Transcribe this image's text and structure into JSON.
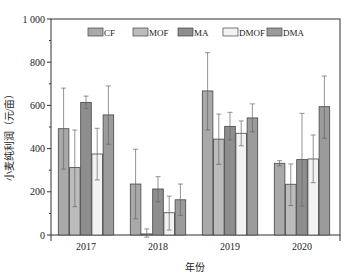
{
  "chart_data": {
    "type": "bar",
    "title": "",
    "xlabel": "年份",
    "ylabel": "小麦纯利润（元/亩）",
    "ylim": [
      0,
      1000
    ],
    "yticks": [
      0,
      200,
      400,
      600,
      800,
      1000
    ],
    "ytick_labels": [
      "0",
      "200",
      "400",
      "600",
      "800",
      "1 000"
    ],
    "categories": [
      "2017",
      "2018",
      "2019",
      "2020"
    ],
    "legend_position": "top-inside",
    "grid": false,
    "series": [
      {
        "name": "CF",
        "color": "#a9a9a9",
        "values": [
          492,
          236,
          667,
          332
        ],
        "error_upper": [
          680,
          397,
          844,
          344
        ],
        "error_lower": [
          305,
          75,
          486,
          320
        ]
      },
      {
        "name": "MOF",
        "color": "#bcbcbc",
        "values": [
          312,
          5,
          444,
          235
        ],
        "error_upper": [
          486,
          28,
          560,
          329
        ],
        "error_lower": [
          131,
          -10,
          327,
          136
        ]
      },
      {
        "name": "MA",
        "color": "#8e8e8e",
        "values": [
          614,
          213,
          503,
          349
        ],
        "error_upper": [
          643,
          270,
          568,
          563
        ],
        "error_lower": [
          585,
          154,
          440,
          134
        ]
      },
      {
        "name": "DMOF",
        "color": "#f2f2f2",
        "values": [
          375,
          103,
          471,
          352
        ],
        "error_upper": [
          494,
          180,
          528,
          463
        ],
        "error_lower": [
          255,
          23,
          413,
          242
        ]
      },
      {
        "name": "DMA",
        "color": "#9b9b9b",
        "values": [
          556,
          163,
          542,
          594
        ],
        "error_upper": [
          690,
          236,
          607,
          736
        ],
        "error_lower": [
          420,
          91,
          478,
          448
        ]
      }
    ]
  }
}
